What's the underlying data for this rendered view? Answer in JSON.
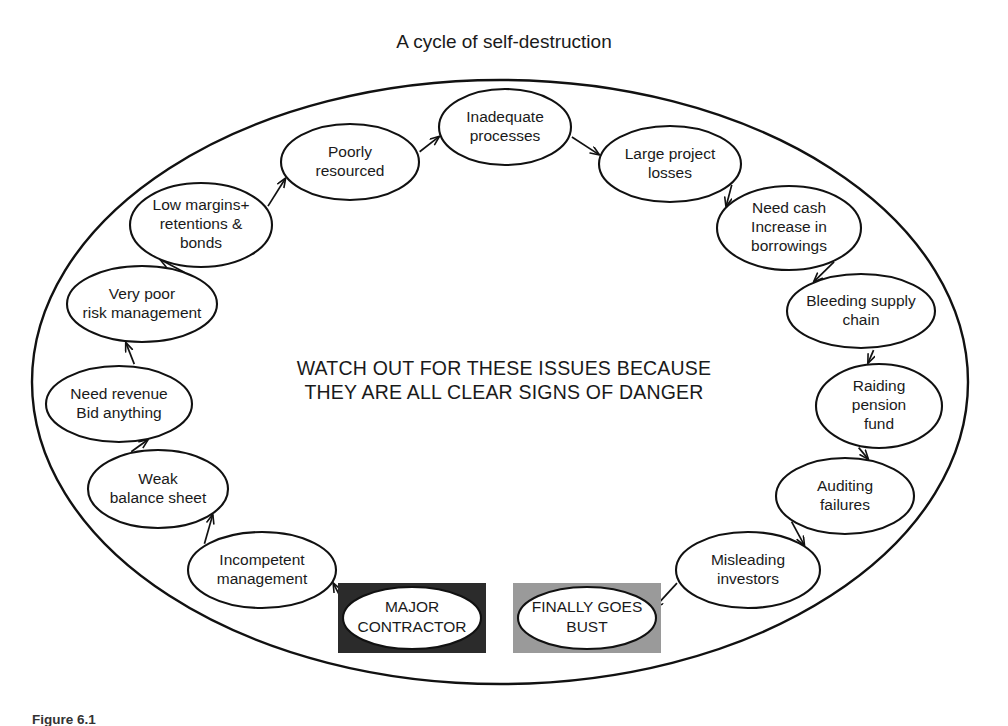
{
  "title": "A cycle of self-destruction",
  "center_text": {
    "line1": "WATCH OUT FOR THESE ISSUES BECAUSE",
    "line2": "THEY ARE ALL CLEAR SIGNS OF DANGER"
  },
  "caption": "Figure 6.1",
  "colors": {
    "background": "#ffffff",
    "stroke": "#111111",
    "text": "#1a1a1a",
    "major_contractor_box": "#2b2b2b",
    "finally_goes_bust_box": "#9a9a9a",
    "node_fill": "#ffffff"
  },
  "nodes": [
    {
      "id": "inadequate-processes",
      "lines": [
        "Inadequate",
        "processes"
      ],
      "cx": 505,
      "cy": 127,
      "rx": 66,
      "ry": 38
    },
    {
      "id": "large-project-losses",
      "lines": [
        "Large project",
        "losses"
      ],
      "cx": 670,
      "cy": 164,
      "rx": 71,
      "ry": 38
    },
    {
      "id": "need-cash-increase-borrowings",
      "lines": [
        "Need cash",
        "Increase in",
        "borrowings"
      ],
      "cx": 789,
      "cy": 228,
      "rx": 72,
      "ry": 42
    },
    {
      "id": "bleeding-supply-chain",
      "lines": [
        "Bleeding supply",
        "chain"
      ],
      "cx": 861,
      "cy": 311,
      "rx": 74,
      "ry": 37
    },
    {
      "id": "raiding-pension-fund",
      "lines": [
        "Raiding",
        "pension",
        "fund"
      ],
      "cx": 879,
      "cy": 406,
      "rx": 63,
      "ry": 42
    },
    {
      "id": "auditing-failures",
      "lines": [
        "Auditing",
        "failures"
      ],
      "cx": 845,
      "cy": 496,
      "rx": 69,
      "ry": 38
    },
    {
      "id": "misleading-investors",
      "lines": [
        "Misleading",
        "investors"
      ],
      "cx": 748,
      "cy": 570,
      "rx": 72,
      "ry": 38
    },
    {
      "id": "incompetent-management",
      "lines": [
        "Incompetent",
        "management"
      ],
      "cx": 262,
      "cy": 570,
      "rx": 74,
      "ry": 38
    },
    {
      "id": "weak-balance-sheet",
      "lines": [
        "Weak",
        "balance sheet"
      ],
      "cx": 158,
      "cy": 489,
      "rx": 70,
      "ry": 39
    },
    {
      "id": "need-revenue-bid-anything",
      "lines": [
        "Need revenue",
        "Bid anything"
      ],
      "cx": 119,
      "cy": 404,
      "rx": 73,
      "ry": 38
    },
    {
      "id": "very-poor-risk-management",
      "lines": [
        "Very poor",
        "risk management"
      ],
      "cx": 142,
      "cy": 304,
      "rx": 75,
      "ry": 38
    },
    {
      "id": "low-margins-retentions-bonds",
      "lines": [
        "Low margins+",
        "retentions &",
        "bonds"
      ],
      "cx": 201,
      "cy": 225,
      "rx": 71,
      "ry": 42
    },
    {
      "id": "poorly-resourced",
      "lines": [
        "Poorly",
        "resourced"
      ],
      "cx": 350,
      "cy": 162,
      "rx": 69,
      "ry": 38
    }
  ],
  "boxed_nodes": [
    {
      "id": "major-contractor",
      "lines": [
        "MAJOR",
        "CONTRACTOR"
      ],
      "box": {
        "x": 338,
        "y": 583,
        "w": 148,
        "h": 70
      },
      "ellipse": {
        "cx": 412,
        "cy": 618,
        "rx": 69,
        "ry": 31
      },
      "box_fill": "#2b2b2b"
    },
    {
      "id": "finally-goes-bust",
      "lines": [
        "FINALLY GOES",
        "BUST"
      ],
      "box": {
        "x": 513,
        "y": 583,
        "w": 148,
        "h": 70
      },
      "ellipse": {
        "cx": 587,
        "cy": 618,
        "rx": 69,
        "ry": 31
      },
      "box_fill": "#9a9a9a"
    }
  ],
  "outer_oval": {
    "cx": 500,
    "cy": 382,
    "rx": 468,
    "ry": 302
  },
  "arrows": [
    {
      "id": "poorly-to-inadequate",
      "from": "poorly-resourced",
      "to": "inadequate-processes"
    },
    {
      "id": "inadequate-to-large-project",
      "from": "inadequate-processes",
      "to": "large-project-losses"
    },
    {
      "id": "large-project-to-need-cash",
      "from": "large-project-losses",
      "to": "need-cash-increase-borrowings"
    },
    {
      "id": "need-cash-to-bleeding",
      "from": "need-cash-increase-borrowings",
      "to": "bleeding-supply-chain"
    },
    {
      "id": "bleeding-to-raiding",
      "from": "bleeding-supply-chain",
      "to": "raiding-pension-fund"
    },
    {
      "id": "raiding-to-auditing",
      "from": "raiding-pension-fund",
      "to": "auditing-failures"
    },
    {
      "id": "auditing-to-misleading",
      "from": "auditing-failures",
      "to": "misleading-investors"
    },
    {
      "id": "misleading-to-finally-goes-bust",
      "from": "misleading-investors",
      "to": "finally-goes-bust"
    },
    {
      "id": "major-contractor-to-incompetent",
      "from": "major-contractor",
      "to": "incompetent-management"
    },
    {
      "id": "incompetent-to-weak-balance",
      "from": "incompetent-management",
      "to": "weak-balance-sheet"
    },
    {
      "id": "weak-balance-to-need-revenue",
      "from": "weak-balance-sheet",
      "to": "need-revenue-bid-anything"
    },
    {
      "id": "need-revenue-to-very-poor-risk",
      "from": "need-revenue-bid-anything",
      "to": "very-poor-risk-management"
    },
    {
      "id": "very-poor-risk-to-low-margins",
      "from": "very-poor-risk-management",
      "to": "low-margins-retentions-bonds"
    },
    {
      "id": "low-margins-to-poorly",
      "from": "low-margins-retentions-bonds",
      "to": "poorly-resourced"
    }
  ]
}
